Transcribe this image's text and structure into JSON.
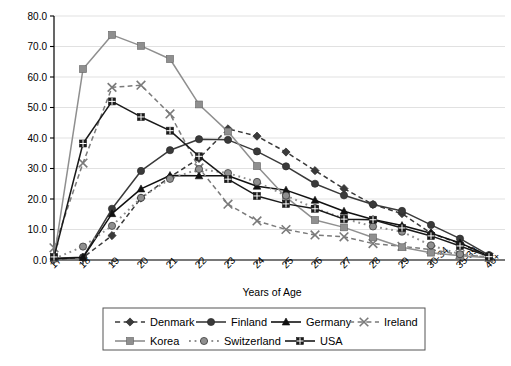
{
  "chart_data": {
    "type": "line",
    "title": "",
    "xlabel": "Years of Age",
    "ylabel": "",
    "ylim": [
      0,
      80
    ],
    "ytick_step": 10,
    "yticks": [
      "0.0",
      "10.0",
      "20.0",
      "30.0",
      "40.0",
      "50.0",
      "60.0",
      "70.0",
      "80.0"
    ],
    "grid": true,
    "legend_position": "bottom",
    "categories": [
      "17",
      "18",
      "19",
      "20",
      "21",
      "22",
      "23",
      "24",
      "25",
      "26",
      "27",
      "28",
      "29",
      "30-34",
      "35-39",
      "40+"
    ],
    "series": [
      {
        "name": "Denmark",
        "color": "#3a3a3a",
        "marker": "diamond",
        "line": "dashed",
        "values": [
          0.3,
          0.8,
          8.0,
          20.3,
          27.2,
          33.3,
          43.0,
          40.6,
          35.4,
          29.3,
          23.4,
          18.2,
          15.2,
          8.8,
          5.4,
          1.4
        ]
      },
      {
        "name": "Finland",
        "color": "#3a3a3a",
        "marker": "circle",
        "line": "solid",
        "values": [
          0.6,
          0.9,
          16.8,
          29.2,
          36.0,
          39.6,
          39.4,
          35.6,
          30.7,
          25.0,
          21.2,
          18.2,
          16.1,
          11.5,
          7.0,
          1.6
        ]
      },
      {
        "name": "Germany",
        "color": "#111111",
        "marker": "triangle",
        "line": "solid",
        "values": [
          0.4,
          0.8,
          15.2,
          23.3,
          27.7,
          27.6,
          27.6,
          24.2,
          22.9,
          19.6,
          16.0,
          13.3,
          11.3,
          8.8,
          5.6,
          1.3
        ]
      },
      {
        "name": "Ireland",
        "color": "#7a7a7a",
        "marker": "cross",
        "line": "dashed",
        "values": [
          4.0,
          31.8,
          56.6,
          57.3,
          47.9,
          30.2,
          18.3,
          12.8,
          10.0,
          8.2,
          7.6,
          5.4,
          4.5,
          3.4,
          1.8,
          0.9
        ]
      },
      {
        "name": "Korea",
        "color": "#8f8f8f",
        "marker": "square",
        "line": "solid",
        "values": [
          0.6,
          62.6,
          73.8,
          70.2,
          65.9,
          51.0,
          42.1,
          30.8,
          20.6,
          13.1,
          10.7,
          7.4,
          4.2,
          2.4,
          1.4,
          0.7
        ]
      },
      {
        "name": "Switzerland",
        "color": "#8f8f8f",
        "marker": "circle",
        "line": "dotted",
        "values": [
          0.4,
          4.4,
          11.2,
          20.4,
          26.6,
          29.8,
          28.5,
          25.6,
          21.1,
          17.0,
          13.6,
          11.0,
          9.3,
          4.8,
          1.9,
          1.0
        ]
      },
      {
        "name": "USA",
        "color": "#1a1a1a",
        "marker": "square-plus",
        "line": "solid",
        "values": [
          1.0,
          38.2,
          52.0,
          46.9,
          42.4,
          34.0,
          26.5,
          21.0,
          18.4,
          16.8,
          13.4,
          13.2,
          10.5,
          7.9,
          4.6,
          1.1
        ]
      }
    ]
  },
  "axes": {
    "x_title": "Years of Age"
  },
  "legend": {
    "entries": [
      {
        "label": "Denmark"
      },
      {
        "label": "Finland"
      },
      {
        "label": "Germany"
      },
      {
        "label": "Ireland"
      },
      {
        "label": "Korea"
      },
      {
        "label": "Switzerland"
      },
      {
        "label": "USA"
      }
    ]
  },
  "colors": {
    "grid": "#d9d9d9",
    "axis": "#000000",
    "background": "#ffffff"
  }
}
